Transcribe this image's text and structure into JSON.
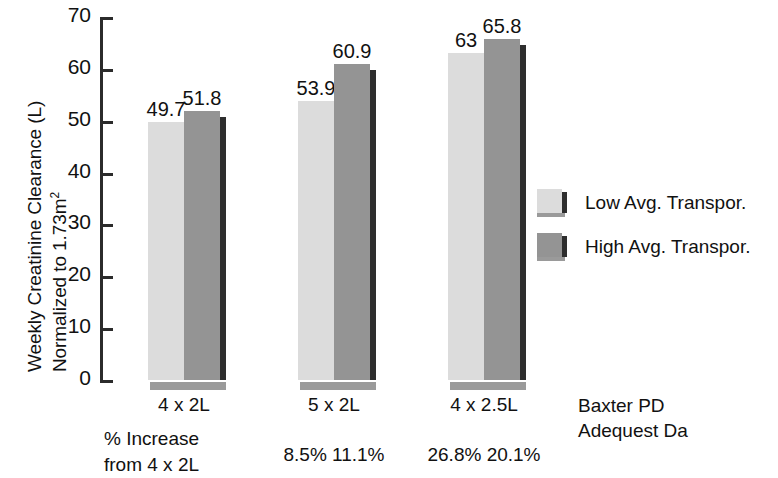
{
  "chart_data": {
    "type": "bar",
    "title": "",
    "xlabel": "",
    "ylabel": "Weekly Creatinine Clearance (L) Normalized to 1.73m2",
    "ylabel_line1": "Weekly Creatinine Clearance (L)",
    "ylabel_line2_prefix": "Normalized to 1.73m",
    "ylabel_line2_sup": "2",
    "ylim": [
      0,
      70
    ],
    "yticks": [
      0,
      10,
      20,
      30,
      40,
      50,
      60,
      70
    ],
    "ytick_labels": [
      "0",
      "10",
      "20",
      "30",
      "40",
      "50",
      "60",
      "70"
    ],
    "grid": false,
    "legend_position": "right",
    "categories": [
      "4 x 2L",
      "5 x 2L",
      "4 x 2.5L"
    ],
    "series": [
      {
        "name": "Low Avg. Transpor.",
        "color": "#dcdcdc",
        "values": [
          49.7,
          53.9,
          63
        ],
        "value_labels": [
          "49.7",
          "53.9",
          "63"
        ],
        "pct_increase_labels": [
          "",
          "8.5%",
          "26.8%"
        ]
      },
      {
        "name": "High Avg. Transpor.",
        "color": "#949494",
        "values": [
          51.8,
          60.9,
          65.8
        ],
        "value_labels": [
          "51.8",
          "60.9",
          "65.8"
        ],
        "pct_increase_labels": [
          "",
          "11.1%",
          "20.1%"
        ]
      }
    ],
    "annotations": {
      "pct_note_line1": "% Increase",
      "pct_note_line2": "from 4 x 2L",
      "pct_row": [
        "",
        "8.5% 11.1%",
        "26.8% 20.1%"
      ],
      "caption_line1": "Baxter PD",
      "caption_line2": "Adequest Da"
    }
  },
  "axis": {
    "ticks": [
      {
        "value": 70,
        "label": "70"
      },
      {
        "value": 60,
        "label": "60"
      },
      {
        "value": 50,
        "label": "50"
      },
      {
        "value": 40,
        "label": "40"
      },
      {
        "value": 30,
        "label": "30"
      },
      {
        "value": 20,
        "label": "20"
      },
      {
        "value": 10,
        "label": "10"
      },
      {
        "value": 0,
        "label": "0"
      }
    ]
  },
  "groups": [
    {
      "xlabel": "4 x 2L",
      "pct": "",
      "bars": [
        {
          "series": "Low Avg. Transpor.",
          "value": 49.7,
          "label": "49.7"
        },
        {
          "series": "High Avg. Transpor.",
          "value": 51.8,
          "label": "51.8"
        }
      ]
    },
    {
      "xlabel": "5 x 2L",
      "pct": "8.5% 11.1%",
      "bars": [
        {
          "series": "Low Avg. Transpor.",
          "value": 53.9,
          "label": "53.9"
        },
        {
          "series": "High Avg. Transpor.",
          "value": 60.9,
          "label": "60.9"
        }
      ]
    },
    {
      "xlabel": "4 x 2.5L",
      "pct": "26.8% 20.1%",
      "bars": [
        {
          "series": "Low Avg. Transpor.",
          "value": 63,
          "label": "63"
        },
        {
          "series": "High Avg. Transpor.",
          "value": 65.8,
          "label": "65.8"
        }
      ]
    }
  ],
  "legend": {
    "items": [
      {
        "label": "Low Avg. Transpor.",
        "swatch": "light"
      },
      {
        "label": "High Avg. Transpor.",
        "swatch": "dark"
      }
    ]
  },
  "footnote": {
    "line1": "% Increase",
    "line2": "from 4 x 2L"
  },
  "caption": {
    "line1": "Baxter PD",
    "line2": "Adequest Da"
  },
  "colors": {
    "low_series": "#dcdcdc",
    "high_series": "#949494",
    "bar_edge": "#2e2e2e",
    "bar_base": "#9a9a9a",
    "axis": "#2b2b2b",
    "text": "#111111",
    "background": "#ffffff"
  }
}
